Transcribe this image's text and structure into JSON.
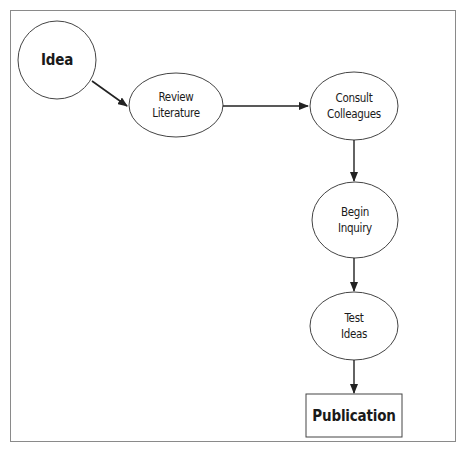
{
  "diagram": {
    "type": "flowchart",
    "nodes": [
      {
        "id": "idea",
        "label": "Idea",
        "shape": "circle",
        "bold": true
      },
      {
        "id": "review",
        "label": "Review\nLiterature",
        "shape": "ellipse"
      },
      {
        "id": "consult",
        "label": "Consult\nColleagues",
        "shape": "ellipse"
      },
      {
        "id": "begin",
        "label": "Begin\nInquiry",
        "shape": "ellipse"
      },
      {
        "id": "test",
        "label": "Test\nIdeas",
        "shape": "ellipse"
      },
      {
        "id": "publication",
        "label": "Publication",
        "shape": "rectangle",
        "bold": true
      }
    ],
    "edges": [
      {
        "from": "idea",
        "to": "review"
      },
      {
        "from": "review",
        "to": "consult"
      },
      {
        "from": "consult",
        "to": "begin"
      },
      {
        "from": "begin",
        "to": "test"
      },
      {
        "from": "test",
        "to": "publication"
      }
    ]
  },
  "colors": {
    "stroke": "#3a3a3a",
    "frame": "#8a8a8a",
    "text": "#1a1a1a",
    "background": "#ffffff"
  }
}
